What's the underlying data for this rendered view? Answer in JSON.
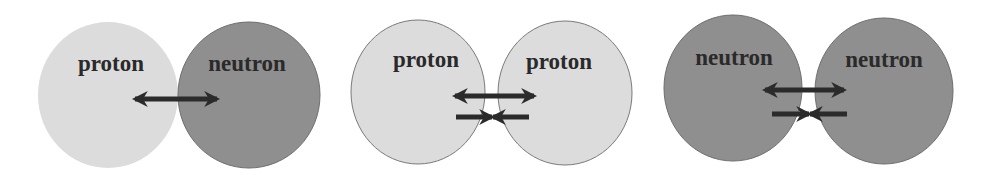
{
  "colors": {
    "proton_fill": "#dcdcdc",
    "neutron_fill": "#8f8f8f",
    "outline": "#6e6e6e",
    "arrow": "#2b2b2b",
    "label": "#2a2a2a"
  },
  "panels": [
    {
      "name": "proton-neutron",
      "left": {
        "label": "proton",
        "type": "proton"
      },
      "right": {
        "label": "neutron",
        "type": "neutron"
      },
      "arrows": [
        "double-arrow"
      ]
    },
    {
      "name": "proton-proton",
      "left": {
        "label": "proton",
        "type": "proton"
      },
      "right": {
        "label": "proton",
        "type": "proton"
      },
      "arrows": [
        "double-arrow",
        "inward-arrows"
      ]
    },
    {
      "name": "neutron-neutron",
      "left": {
        "label": "neutron",
        "type": "neutron"
      },
      "right": {
        "label": "neutron",
        "type": "neutron"
      },
      "arrows": [
        "double-arrow",
        "inward-arrows"
      ]
    }
  ]
}
